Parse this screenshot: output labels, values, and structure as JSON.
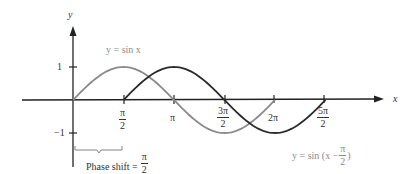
{
  "chart_data": {
    "type": "line",
    "title": "",
    "xlabel": "x",
    "ylabel": "y",
    "xlim": [
      0,
      8.2
    ],
    "ylim": [
      -1,
      1
    ],
    "grid": false,
    "x_tick_labels": [
      "π/2",
      "π",
      "3π/2",
      "2π",
      "5π/2"
    ],
    "x_tick_values": [
      1.5708,
      3.1416,
      4.7124,
      6.2832,
      7.854
    ],
    "y_tick_labels": [
      "1",
      "−1"
    ],
    "y_tick_values": [
      1,
      -1
    ],
    "series": [
      {
        "name": "y = sin x",
        "color": "#8a8a8a",
        "domain": [
          0,
          6.2832
        ],
        "x": [
          0,
          1.5708,
          3.1416,
          4.7124,
          6.2832
        ],
        "y": [
          0,
          1,
          0,
          -1,
          0
        ]
      },
      {
        "name": "y = sin (x − π/2)",
        "color": "#2a2a2a",
        "domain": [
          1.5708,
          7.854
        ],
        "x": [
          1.5708,
          3.1416,
          4.7124,
          6.2832,
          7.854
        ],
        "y": [
          0,
          1,
          0,
          -1,
          0
        ]
      }
    ],
    "annotations": [
      {
        "text": "Phase shift = π/2",
        "position": "below x-axis between 0 and π/2"
      }
    ]
  },
  "labels": {
    "y_axis": "y",
    "x_axis": "x",
    "y_tick_pos": "1",
    "y_tick_neg": "−1",
    "pi": "π",
    "two": "2",
    "three_pi": "3π",
    "five_pi": "5π",
    "two_pi": "2π",
    "sin_label": "y = sin x",
    "shift_label_prefix": "y = sin (x −",
    "shift_label_suffix": ")",
    "phase_shift_text": "Phase shift ="
  }
}
